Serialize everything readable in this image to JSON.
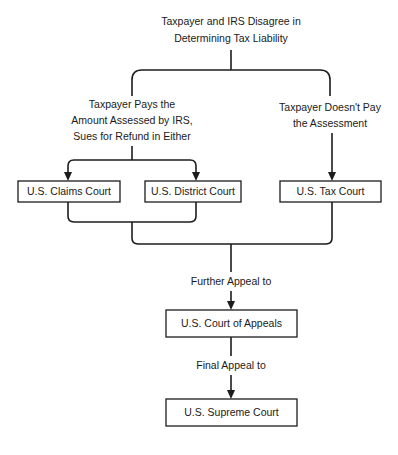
{
  "diagram": {
    "title_caption": {
      "lines": [
        "Taxpayer and IRS Disagree in",
        "Determining Tax Liability"
      ],
      "line1": "Taxpayer and IRS Disagree in",
      "line2": "Determining Tax Liability"
    },
    "left_branch_caption": {
      "line1": "Taxpayer Pays the",
      "line2": "Amount Assessed by IRS,",
      "line3": "Sues for Refund in Either"
    },
    "right_branch_caption": {
      "line1": "Taxpayer Doesn't Pay",
      "line2": "the Assessment"
    },
    "further_appeal_caption": "Further Appeal to",
    "final_appeal_caption": "Final Appeal to",
    "nodes": {
      "claims_court": "U.S. Claims Court",
      "district_court": "U.S. District Court",
      "tax_court": "U.S. Tax Court",
      "court_of_appeals": "U.S. Court of Appeals",
      "supreme_court": "U.S. Supreme Court"
    },
    "colors": {
      "background": "#ffffff",
      "line": "#1c1c1c",
      "box_stroke": "#1c1c1c",
      "box_fill": "#ffffff",
      "text": "#1a1a1a"
    }
  }
}
